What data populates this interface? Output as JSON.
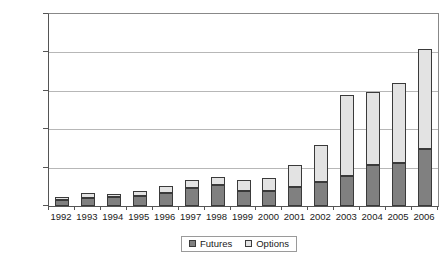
{
  "chart_data": {
    "type": "bar",
    "subtype": "stacked",
    "title": "",
    "subtitle": "",
    "xlabel": "",
    "ylabel": "",
    "categories": [
      "1992",
      "1993",
      "1994",
      "1995",
      "1996",
      "1997",
      "1998",
      "1999",
      "2000",
      "2001",
      "2002",
      "2003",
      "2004",
      "2005",
      "2006"
    ],
    "series": [
      {
        "name": "Futures",
        "color": "#808080",
        "values": [
          800,
          1050,
          1150,
          1300,
          1700,
          2400,
          2700,
          1950,
          1900,
          2500,
          3100,
          3900,
          5300,
          5600,
          7400
        ]
      },
      {
        "name": "Options",
        "color": "#e3e3e3",
        "values": [
          350,
          600,
          450,
          700,
          850,
          950,
          1100,
          1450,
          1750,
          2800,
          4900,
          10500,
          9500,
          10400,
          13000
        ]
      }
    ],
    "totals": [
      1150,
      1650,
      1600,
      2000,
      2550,
      3350,
      3800,
      3400,
      3650,
      5300,
      8000,
      14400,
      14800,
      16000,
      20400
    ],
    "ylim": [
      0,
      25000
    ],
    "ytick_values": [
      0,
      5000,
      10000,
      15000,
      20000,
      25000
    ],
    "ytick_labels": [
      "0",
      "5000",
      "10,000",
      "15,000",
      "20,000",
      "25,000"
    ],
    "grid": true,
    "legend": {
      "position": "bottom",
      "entries": [
        {
          "label": "Futures",
          "swatch": "futures-swatch-icon"
        },
        {
          "label": "Options",
          "swatch": "options-swatch-icon"
        }
      ]
    }
  }
}
